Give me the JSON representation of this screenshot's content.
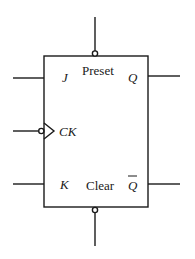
{
  "diagram": {
    "type": "JK flip-flop symbol",
    "colors": {
      "line": "#1a1a1a",
      "background": "#ffffff"
    },
    "labels": {
      "j": "J",
      "k": "K",
      "ck": "CK",
      "q": "Q",
      "q_bar": "Q",
      "preset": "Preset",
      "clear": "Clear"
    },
    "pins": [
      {
        "name": "J",
        "side": "left",
        "inverted": false
      },
      {
        "name": "CK",
        "side": "left",
        "inverted": true,
        "edge_triggered": true
      },
      {
        "name": "K",
        "side": "left",
        "inverted": false
      },
      {
        "name": "Q",
        "side": "right",
        "inverted": false
      },
      {
        "name": "Q-bar",
        "side": "right",
        "inverted": false
      },
      {
        "name": "Preset",
        "side": "top",
        "inverted": true
      },
      {
        "name": "Clear",
        "side": "bottom",
        "inverted": true
      }
    ]
  }
}
